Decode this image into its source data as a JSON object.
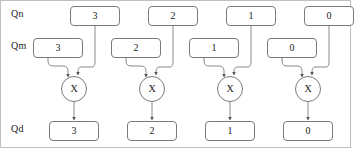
{
  "diagram": {
    "row_labels": [
      {
        "id": "qn",
        "text": "Qn"
      },
      {
        "id": "qm",
        "text": "Qm"
      },
      {
        "id": "qd",
        "text": "Qd"
      }
    ],
    "operator_glyph": "X",
    "colors": {
      "stroke": "#7a7a7a",
      "text": "#1a1a1a",
      "background": "#ffffff",
      "border": "#bfbfbf"
    },
    "stages": [
      {
        "index": 1,
        "qn": "3",
        "qm": "3",
        "qd": "3",
        "operator": "X"
      },
      {
        "index": 2,
        "qn": "2",
        "qm": "2",
        "qd": "2",
        "operator": "X"
      },
      {
        "index": 3,
        "qn": "1",
        "qm": "1",
        "qd": "1",
        "operator": "X"
      },
      {
        "index": 4,
        "qn": "0",
        "qm": "0",
        "qd": "0",
        "operator": "X"
      }
    ]
  }
}
